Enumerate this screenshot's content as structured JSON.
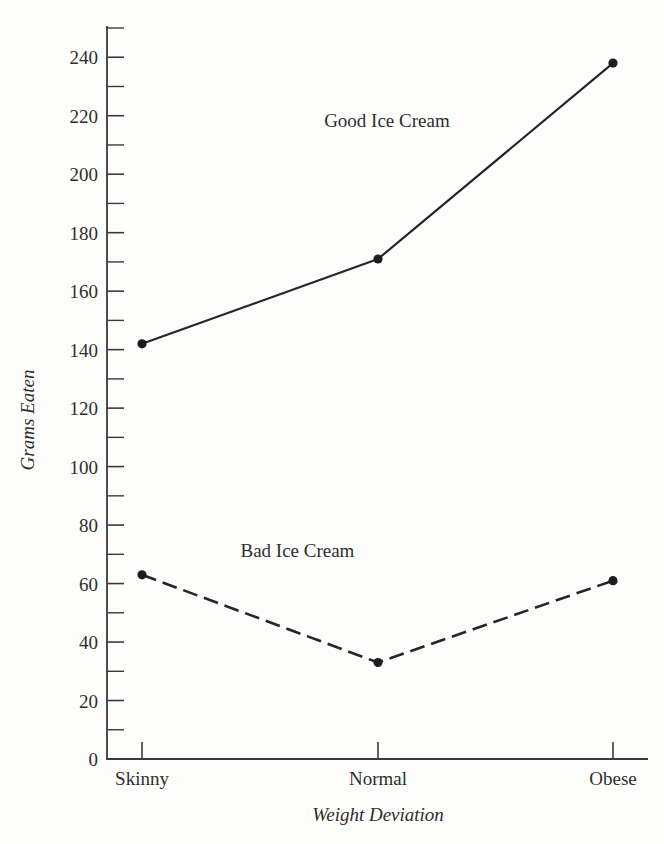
{
  "chart_data": {
    "type": "line",
    "title": "",
    "xlabel": "Weight Deviation",
    "ylabel": "Grams Eaten",
    "categories": [
      "Skinny",
      "Normal",
      "Obese"
    ],
    "ylim": [
      0,
      250
    ],
    "xlim": [
      0,
      1
    ],
    "grid": false,
    "legend_position": "inline-annotation",
    "y_major_ticks": [
      0,
      20,
      40,
      60,
      80,
      100,
      120,
      140,
      160,
      180,
      200,
      220,
      240
    ],
    "y_major_tick_labels": [
      "0",
      "20",
      "40",
      "60",
      "80",
      "100",
      "120",
      "140",
      "160",
      "180",
      "200",
      "220",
      "240"
    ],
    "y_minor_ticks": [
      10,
      30,
      50,
      70,
      90,
      110,
      130,
      150,
      170,
      190,
      210,
      230,
      250
    ],
    "series": [
      {
        "name": "Good Ice Cream",
        "style": "solid",
        "marker": "filled-circle",
        "values": [
          142,
          171,
          238
        ],
        "label_x": 0.52,
        "label_y": 216
      },
      {
        "name": "Bad Ice Cream",
        "style": "dashed",
        "marker": "filled-circle",
        "values": [
          63,
          33,
          61
        ],
        "label_x": 0.33,
        "label_y": 69
      }
    ]
  },
  "axes": {
    "y_axis_title": "Grams Eaten",
    "x_axis_title": "Weight Deviation"
  }
}
